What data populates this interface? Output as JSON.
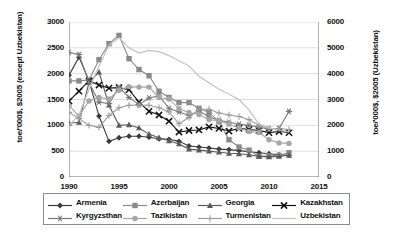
{
  "chart_data": {
    "type": "line",
    "title": "",
    "xlabel": "",
    "ylabel": "toe/'000$, $2005 (except Uzbekistan)",
    "ylabel_right": "toe/'000$, $2005 (Uzbekistan)",
    "xlim": [
      1990,
      2015
    ],
    "ylim": [
      0,
      3000
    ],
    "ylim_right": [
      0,
      6000
    ],
    "xticks": [
      "1990",
      "1995",
      "2000",
      "2005",
      "2010",
      "2015"
    ],
    "xtick_values": [
      1990,
      1995,
      2000,
      2005,
      2010,
      2015
    ],
    "yticks_left": [
      "0",
      "500",
      "1000",
      "1500",
      "2000",
      "2500",
      "3000"
    ],
    "ytick_values_left": [
      0,
      500,
      1000,
      1500,
      2000,
      2500,
      3000
    ],
    "yticks_right": [
      "0",
      "1000",
      "2000",
      "3000",
      "4000",
      "5000",
      "6000"
    ],
    "ytick_values_right": [
      0,
      1000,
      2000,
      3000,
      4000,
      5000,
      6000
    ],
    "grid": true,
    "grid_axis": "y",
    "legend_position": "bottom",
    "x": [
      1990,
      1991,
      1992,
      1993,
      1994,
      1995,
      1996,
      1997,
      1998,
      1999,
      2000,
      2001,
      2002,
      2003,
      2004,
      2005,
      2006,
      2007,
      2008,
      2009,
      2010,
      2011,
      2012
    ],
    "series": [
      {
        "name": "Armenia",
        "axis": "left",
        "marker": "diamond",
        "color": "#3a3a3a",
        "values": [
          1970,
          2320,
          1860,
          1180,
          690,
          760,
          790,
          790,
          770,
          740,
          730,
          690,
          600,
          580,
          560,
          540,
          530,
          510,
          490,
          470,
          450,
          430,
          420
        ]
      },
      {
        "name": "Azerbaijan",
        "axis": "left",
        "marker": "square",
        "color": "#8a8a8a",
        "values": [
          1860,
          1860,
          1880,
          2270,
          2580,
          2740,
          2290,
          2080,
          1960,
          1660,
          1540,
          1440,
          1440,
          1330,
          1250,
          1070,
          720,
          580,
          520,
          400,
          410,
          420,
          470
        ]
      },
      {
        "name": "Georgia",
        "axis": "left",
        "marker": "triangle",
        "color": "#5a5a5a",
        "values": [
          1040,
          1060,
          1830,
          2030,
          1390,
          1000,
          1010,
          950,
          830,
          760,
          700,
          640,
          540,
          520,
          500,
          480,
          460,
          450,
          430,
          400,
          390,
          400,
          420
        ]
      },
      {
        "name": "Kazakhstan",
        "axis": "left",
        "marker": "x",
        "color": "#111111",
        "values": [
          1470,
          1660,
          1860,
          1780,
          1720,
          1730,
          1690,
          1450,
          1270,
          1200,
          1080,
          870,
          900,
          910,
          970,
          940,
          890,
          940,
          920,
          900,
          860,
          880,
          860
        ]
      },
      {
        "name": "Kyrgyzsthan",
        "axis": "left",
        "marker": "asterisk",
        "color": "#7a7a7a",
        "values": [
          2410,
          2370,
          1830,
          1450,
          1420,
          1740,
          1540,
          1400,
          1530,
          1570,
          1330,
          1260,
          1190,
          1280,
          1160,
          1100,
          1060,
          1020,
          1000,
          960,
          930,
          940,
          1270
        ]
      },
      {
        "name": "Tazikistan",
        "axis": "left",
        "marker": "circle",
        "color": "#a6a6a6",
        "values": [
          1380,
          1180,
          1470,
          1540,
          1510,
          1680,
          1750,
          1740,
          1740,
          1540,
          1510,
          1320,
          1250,
          1210,
          1110,
          1090,
          1020,
          950,
          880,
          860,
          720,
          660,
          650
        ]
      },
      {
        "name": "Turmenistan",
        "axis": "left",
        "marker": "plus",
        "color": "#9c9c9c",
        "values": [
          1250,
          1130,
          1000,
          960,
          1190,
          1340,
          1390,
          1390,
          1390,
          1340,
          1260,
          1030,
          1150,
          1310,
          1310,
          1240,
          1200,
          1170,
          1110,
          1000,
          940,
          940,
          920
        ]
      },
      {
        "name": "Uzbekistan",
        "axis": "right",
        "marker": "none",
        "color": "#c2c2c2",
        "values": [
          2000,
          2400,
          3400,
          4300,
          5100,
          5400,
          5000,
          4800,
          4900,
          4850,
          4700,
          4500,
          4300,
          3900,
          3650,
          3400,
          3200,
          3000,
          2600,
          2050,
          1900,
          1820,
          1750
        ]
      }
    ]
  },
  "legend": {
    "items": [
      {
        "label": "Armenia",
        "marker": "diamond",
        "color": "#3a3a3a"
      },
      {
        "label": "Azerbaijan",
        "marker": "square",
        "color": "#8a8a8a"
      },
      {
        "label": "Georgia",
        "marker": "triangle",
        "color": "#5a5a5a"
      },
      {
        "label": "Kazakhstan",
        "marker": "x",
        "color": "#111111"
      },
      {
        "label": "Kyrgyzsthan",
        "marker": "asterisk",
        "color": "#7a7a7a"
      },
      {
        "label": "Tazikistan",
        "marker": "circle",
        "color": "#a6a6a6"
      },
      {
        "label": "Turmenistan",
        "marker": "plus",
        "color": "#9c9c9c"
      },
      {
        "label": "Uzbekistan",
        "marker": "none",
        "color": "#c2c2c2"
      }
    ]
  }
}
